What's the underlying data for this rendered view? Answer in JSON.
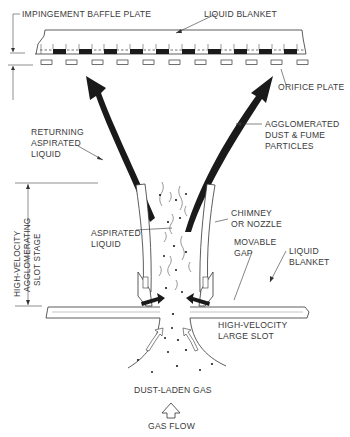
{
  "figure": {
    "type": "technical-diagram"
  },
  "labels": {
    "impingement_baffle_plate": "IMPINGEMENT BAFFLE PLATE",
    "liquid_blanket_top": "LIQUID BLANKET",
    "orifice_plate": "ORIFICE PLATE",
    "returning_aspirated_liquid": [
      "RETURNING",
      "ASPIRATED",
      "LIQUID"
    ],
    "agglomerated_particles": [
      "AGGLOMERATED",
      "DUST & FUME",
      "PARTICLES"
    ],
    "stage_dimension": [
      "HIGH-VELOCITY",
      "AGGLOMERATING",
      "SLOT STAGE"
    ],
    "aspirated_liquid": [
      "ASPIRATED",
      "LIQUID"
    ],
    "chimney": [
      "CHIMNEY",
      "OR NOZZLE"
    ],
    "movable_gap": [
      "MOVABLE",
      "GAP"
    ],
    "liquid_blanket_side": [
      "LIQUID",
      "BLANKET"
    ],
    "large_slot": [
      "HIGH-VELOCITY",
      "LARGE SLOT"
    ],
    "dust_laden_gas": "DUST-LADEN GAS",
    "gas_flow": "GAS FLOW"
  },
  "colors": {
    "ink": "#1a1a1a",
    "text": "#3a3a3a",
    "background": "#ffffff"
  }
}
